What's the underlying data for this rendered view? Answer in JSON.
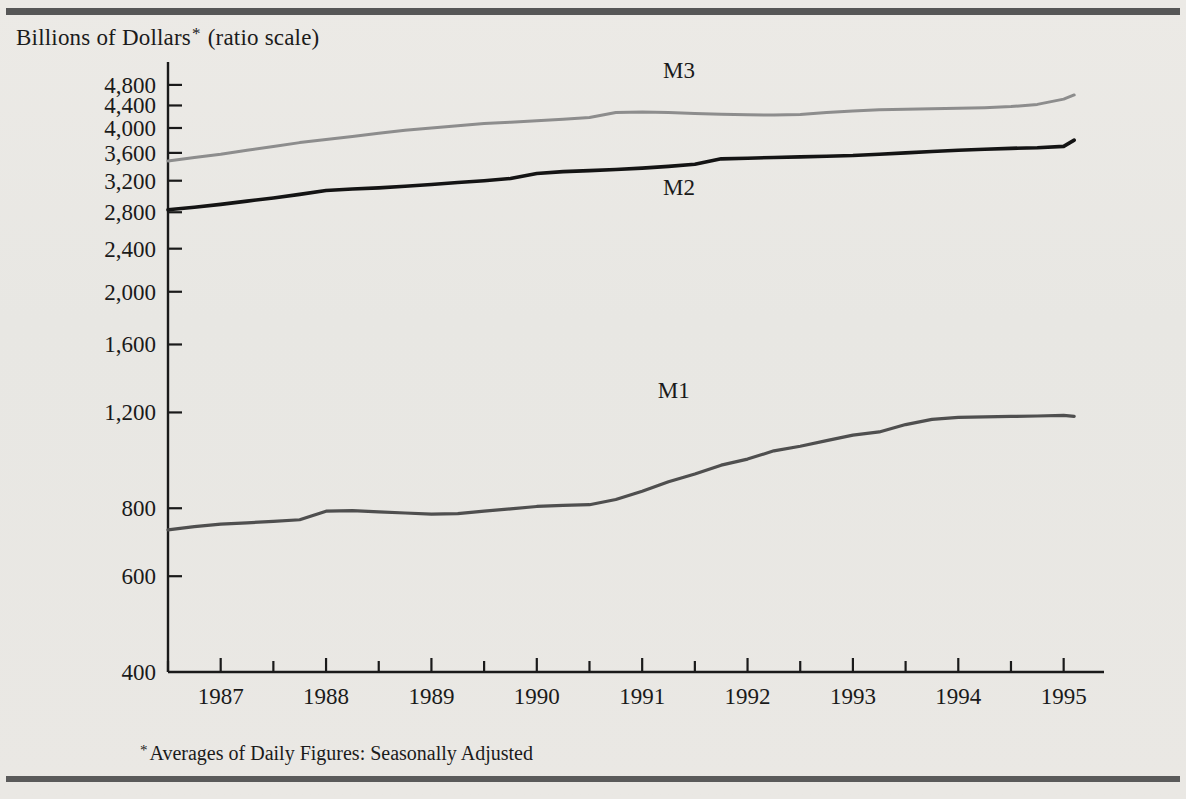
{
  "figure": {
    "axis_title": "Billions of Dollars",
    "axis_title_suffix": "(ratio scale)",
    "asterisk": "*",
    "footnote": "Averages of Daily Figures: Seasonally Adjusted"
  },
  "chart_data": {
    "type": "line",
    "title": "Billions of Dollars* (ratio scale)",
    "xlabel": "",
    "ylabel": "Billions of Dollars",
    "yscale": "log",
    "ylim": [
      400,
      5200
    ],
    "xlim": [
      1986.5,
      1995.25
    ],
    "grid": false,
    "legend": "inline-labels",
    "ytick_labels": [
      "4,800",
      "4,400",
      "4,000",
      "3,600",
      "3,200",
      "2,800",
      "2,400",
      "2,000",
      "1,600",
      "1,200",
      "800",
      "600",
      "400"
    ],
    "ytick_values": [
      4800,
      4400,
      4000,
      3600,
      3200,
      2800,
      2400,
      2000,
      1600,
      1200,
      800,
      600,
      400
    ],
    "xtick_labels": [
      "1987",
      "1988",
      "1989",
      "1990",
      "1991",
      "1992",
      "1993",
      "1994",
      "1995"
    ],
    "xtick_values": [
      1987,
      1988,
      1989,
      1990,
      1991,
      1992,
      1993,
      1994,
      1995
    ],
    "x_minor_step": 0.5,
    "x": [
      1986.5,
      1986.75,
      1987.0,
      1987.25,
      1987.5,
      1987.75,
      1988.0,
      1988.25,
      1988.5,
      1988.75,
      1989.0,
      1989.25,
      1989.5,
      1989.75,
      1990.0,
      1990.25,
      1990.5,
      1990.75,
      1991.0,
      1991.25,
      1991.5,
      1991.75,
      1992.0,
      1992.25,
      1992.5,
      1992.75,
      1993.0,
      1993.25,
      1993.5,
      1993.75,
      1994.0,
      1994.25,
      1994.5,
      1994.75,
      1995.0,
      1995.1
    ],
    "series": [
      {
        "name": "M3",
        "color": "#8d8d8d",
        "width": 3.0,
        "label_x": 1991.35,
        "label_y": 4950,
        "values": [
          3480,
          3530,
          3580,
          3640,
          3700,
          3760,
          3810,
          3860,
          3910,
          3960,
          4000,
          4040,
          4075,
          4100,
          4125,
          4150,
          4180,
          4270,
          4280,
          4270,
          4255,
          4240,
          4230,
          4225,
          4235,
          4270,
          4300,
          4320,
          4330,
          4340,
          4350,
          4360,
          4380,
          4420,
          4520,
          4600
        ]
      },
      {
        "name": "M2",
        "color": "#141414",
        "width": 3.6,
        "label_x": 1991.35,
        "label_y": 3010,
        "values": [
          2830,
          2860,
          2895,
          2935,
          2975,
          3020,
          3070,
          3090,
          3105,
          3125,
          3150,
          3175,
          3200,
          3230,
          3300,
          3325,
          3340,
          3355,
          3375,
          3400,
          3430,
          3510,
          3520,
          3530,
          3540,
          3550,
          3560,
          3580,
          3600,
          3620,
          3640,
          3655,
          3670,
          3680,
          3700,
          3800
        ]
      },
      {
        "name": "M1",
        "color": "#4f4f4f",
        "width": 3.2,
        "label_x": 1991.3,
        "label_y": 1275,
        "values": [
          730,
          740,
          748,
          752,
          757,
          762,
          790,
          792,
          788,
          784,
          780,
          782,
          790,
          798,
          806,
          810,
          812,
          830,
          860,
          895,
          925,
          960,
          985,
          1020,
          1040,
          1065,
          1090,
          1105,
          1140,
          1165,
          1175,
          1178,
          1180,
          1182,
          1185,
          1180
        ]
      }
    ]
  }
}
